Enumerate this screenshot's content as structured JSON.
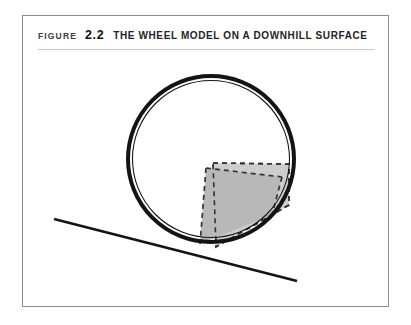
{
  "figure": {
    "label": "FIGURE",
    "number": "2.2",
    "title": "THE WHEEL MODEL ON A DOWNHILL SURFACE"
  },
  "colors": {
    "frame_border": "#8d8d8d",
    "rule": "#c9c9c9",
    "caption_label": "#3b3b3b",
    "caption_number": "#111111",
    "caption_title": "#242424",
    "wheel_stroke": "#141414",
    "slope_stroke": "#141414",
    "block_fill": "#b8b8b8",
    "ghost_fill": "#cdcdcd",
    "dashed_stroke": "#333333",
    "background": "#ffffff"
  },
  "diagram": {
    "name": "wheel-on-downhill-surface",
    "wheel": {
      "name": "wheel-circle",
      "cx": 188,
      "cy": 143,
      "r": 83,
      "outer_stroke_width": 4,
      "inner_stroke_width": 1.1,
      "inner_r": 78.5
    },
    "slope": {
      "name": "downhill-surface-line",
      "x1": 31,
      "y1": 203,
      "x2": 274,
      "y2": 265,
      "stroke_width": 2.6
    },
    "ghost_block": {
      "name": "ghost-block-dashed",
      "points": "190,147 266,148 266,189 193,231",
      "dash": "5 4",
      "stroke_width": 1.6
    },
    "solid_block": {
      "name": "tilted-block-filled",
      "points": "183,152 259,161 249,199 177,228",
      "stroke_width": 0
    }
  }
}
